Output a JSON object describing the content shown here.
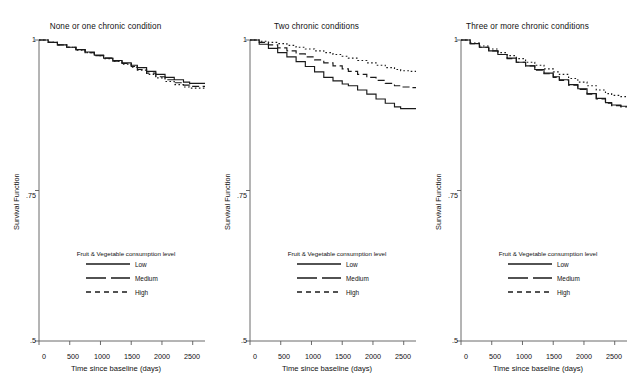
{
  "chart_data": {
    "type": "line",
    "title": "",
    "xlabel": "Time since baseline (days)",
    "ylabel": "Survival Function",
    "xlim": [
      0,
      2700
    ],
    "ylim": [
      0.5,
      1.0
    ],
    "xticks": [
      0,
      500,
      1000,
      1500,
      2000,
      2500
    ],
    "xticklabels": [
      "0",
      "500",
      "1000",
      "1500",
      "2000",
      "2500"
    ],
    "yticks": [
      0.5,
      0.75,
      1.0
    ],
    "yticklabels": [
      ".5",
      ".75",
      "1"
    ],
    "grid": false,
    "legend_position": "lower center",
    "legend_title": "Fruit & Vegetable consumption level",
    "legend_entries": [
      {
        "name": "Low",
        "style": "solid"
      },
      {
        "name": "Medium",
        "style": "dashed"
      },
      {
        "name": "High",
        "style": "dotted"
      }
    ],
    "panels": [
      {
        "title": "None or one chronic condition",
        "x": [
          0,
          150,
          300,
          450,
          600,
          750,
          900,
          1050,
          1200,
          1350,
          1500,
          1600,
          1750,
          1900,
          2050,
          2200,
          2350,
          2450,
          2600,
          2700
        ],
        "series": [
          {
            "name": "Low",
            "style": "solid",
            "values": [
              1.0,
              0.996,
              0.992,
              0.988,
              0.984,
              0.98,
              0.975,
              0.97,
              0.966,
              0.962,
              0.958,
              0.954,
              0.948,
              0.943,
              0.938,
              0.934,
              0.93,
              0.928,
              0.928,
              0.928
            ]
          },
          {
            "name": "Medium",
            "style": "dashed",
            "values": [
              1.0,
              0.996,
              0.992,
              0.988,
              0.984,
              0.979,
              0.974,
              0.97,
              0.965,
              0.961,
              0.956,
              0.951,
              0.945,
              0.939,
              0.934,
              0.929,
              0.925,
              0.923,
              0.923,
              0.923
            ]
          },
          {
            "name": "High",
            "style": "dotted",
            "values": [
              1.0,
              0.996,
              0.992,
              0.988,
              0.983,
              0.979,
              0.974,
              0.969,
              0.965,
              0.96,
              0.955,
              0.95,
              0.943,
              0.937,
              0.931,
              0.926,
              0.922,
              0.92,
              0.92,
              0.92
            ]
          }
        ]
      },
      {
        "title": "Two chronic conditions",
        "x": [
          0,
          150,
          300,
          450,
          600,
          750,
          900,
          1050,
          1200,
          1350,
          1500,
          1600,
          1750,
          1900,
          2050,
          2200,
          2350,
          2450,
          2600,
          2700
        ],
        "series": [
          {
            "name": "Low",
            "style": "solid",
            "values": [
              1.0,
              0.993,
              0.986,
              0.979,
              0.972,
              0.964,
              0.956,
              0.947,
              0.938,
              0.932,
              0.927,
              0.924,
              0.917,
              0.91,
              0.902,
              0.895,
              0.889,
              0.886,
              0.886,
              0.886
            ]
          },
          {
            "name": "Medium",
            "style": "dashed",
            "values": [
              1.0,
              0.996,
              0.992,
              0.987,
              0.982,
              0.977,
              0.972,
              0.967,
              0.962,
              0.957,
              0.952,
              0.948,
              0.943,
              0.938,
              0.933,
              0.928,
              0.924,
              0.922,
              0.921,
              0.921
            ]
          },
          {
            "name": "High",
            "style": "dotted",
            "values": [
              1.0,
              0.998,
              0.996,
              0.994,
              0.991,
              0.988,
              0.985,
              0.982,
              0.979,
              0.976,
              0.973,
              0.97,
              0.966,
              0.962,
              0.958,
              0.954,
              0.951,
              0.949,
              0.948,
              0.948
            ]
          }
        ]
      },
      {
        "title": "Three or more chronic conditions",
        "x": [
          0,
          150,
          300,
          450,
          600,
          750,
          900,
          1050,
          1200,
          1350,
          1500,
          1600,
          1750,
          1900,
          2050,
          2200,
          2350,
          2450,
          2600,
          2700
        ],
        "series": [
          {
            "name": "Low",
            "style": "solid",
            "values": [
              1.0,
              0.994,
              0.988,
              0.982,
              0.976,
              0.97,
              0.963,
              0.957,
              0.951,
              0.945,
              0.939,
              0.934,
              0.926,
              0.919,
              0.911,
              0.903,
              0.896,
              0.892,
              0.89,
              0.89
            ]
          },
          {
            "name": "Medium",
            "style": "dashed",
            "values": [
              1.0,
              0.994,
              0.988,
              0.982,
              0.976,
              0.969,
              0.963,
              0.957,
              0.95,
              0.944,
              0.938,
              0.933,
              0.925,
              0.918,
              0.91,
              0.902,
              0.895,
              0.891,
              0.889,
              0.889
            ]
          },
          {
            "name": "High",
            "style": "dotted",
            "values": [
              1.0,
              0.995,
              0.99,
              0.985,
              0.979,
              0.974,
              0.969,
              0.963,
              0.958,
              0.952,
              0.947,
              0.943,
              0.936,
              0.93,
              0.924,
              0.917,
              0.911,
              0.908,
              0.906,
              0.906
            ]
          }
        ]
      }
    ]
  },
  "panel1": {
    "title": "None or one chronic condition",
    "legend_title": "Fruit & Vegetable consumption level",
    "legend": {
      "low": "Low",
      "medium": "Medium",
      "high": "High"
    },
    "ylabel": "Survival Function",
    "xlabel": "Time since baseline (days)",
    "yticks": {
      "t0": "1",
      "t1": ".75",
      "t2": ".5"
    },
    "xticks": {
      "t0": "0",
      "t1": "500",
      "t2": "1000",
      "t3": "1500",
      "t4": "2000",
      "t5": "2500"
    }
  },
  "panel2": {
    "title": "Two chronic conditions",
    "legend_title": "Fruit & Vegetable consumption level",
    "legend": {
      "low": "Low",
      "medium": "Medium",
      "high": "High"
    },
    "ylabel": "Survival Function",
    "xlabel": "Time since baseline (days)",
    "yticks": {
      "t0": "1",
      "t1": ".75",
      "t2": ".5"
    },
    "xticks": {
      "t0": "0",
      "t1": "500",
      "t2": "1000",
      "t3": "1500",
      "t4": "2000",
      "t5": "2500"
    }
  },
  "panel3": {
    "title": "Three or more chronic conditions",
    "legend_title": "Fruit & Vegetable consumption level",
    "legend": {
      "low": "Low",
      "medium": "Medium",
      "high": "High"
    },
    "ylabel": "Survival Function",
    "xlabel": "Time since baseline (days)",
    "yticks": {
      "t0": "1",
      "t1": ".75",
      "t2": ".5"
    },
    "xticks": {
      "t0": "0",
      "t1": "500",
      "t2": "1000",
      "t3": "1500",
      "t4": "2000",
      "t5": "2500"
    }
  },
  "colors": {
    "line": "#1a1a1a",
    "axis": "#5a5a5a",
    "background": "#ffffff"
  }
}
